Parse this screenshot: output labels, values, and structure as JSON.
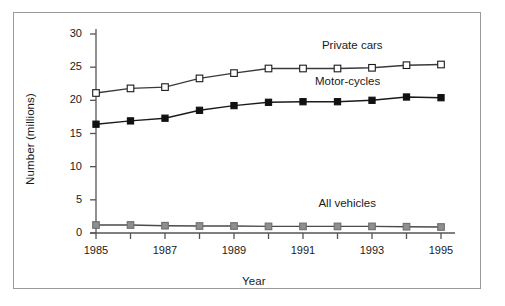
{
  "chart_data": {
    "type": "line",
    "title": "",
    "xlabel": "Year",
    "ylabel": "Number (millions)",
    "x": [
      1985,
      1986,
      1987,
      1988,
      1989,
      1990,
      1991,
      1992,
      1993,
      1994,
      1995
    ],
    "xtick_labels": [
      "1985",
      "1987",
      "1989",
      "1991",
      "1993",
      "1995"
    ],
    "xtick_values": [
      1985,
      1987,
      1989,
      1991,
      1993,
      1995
    ],
    "xlim": [
      1985,
      1995
    ],
    "ytick_labels": [
      "0",
      "5",
      "10",
      "15",
      "20",
      "25",
      "30"
    ],
    "ytick_values": [
      0,
      5,
      10,
      15,
      20,
      25,
      30
    ],
    "ylim": [
      0,
      30
    ],
    "grid": false,
    "legend_position": "inline-right-annotations",
    "series": [
      {
        "name": "Private cars",
        "marker": "open-square",
        "marker_fill": "#ffffff",
        "marker_edge": "#1a1a1a",
        "line_color": "#3a3a3a",
        "values": [
          21.1,
          21.8,
          22.0,
          23.3,
          24.1,
          24.8,
          24.8,
          24.8,
          24.9,
          25.3,
          25.4
        ]
      },
      {
        "name": "Motor-cycles",
        "marker": "filled-square",
        "marker_fill": "#111111",
        "marker_edge": "#111111",
        "line_color": "#1a1a1a",
        "values": [
          16.4,
          16.9,
          17.3,
          18.5,
          19.2,
          19.7,
          19.8,
          19.8,
          20.0,
          20.5,
          20.4
        ]
      },
      {
        "name": "All vehicles",
        "marker": "gray-square",
        "marker_fill": "#8f8f8f",
        "marker_edge": "#6e6e6e",
        "line_color": "#4a4a4a",
        "values": [
          1.2,
          1.2,
          1.1,
          1.05,
          1.05,
          1.0,
          1.0,
          1.0,
          1.0,
          0.95,
          0.9
        ]
      }
    ],
    "annotations": [
      {
        "text": "Private cars",
        "x": 1993.2,
        "y": 28.0
      },
      {
        "text": "Motor-cycles",
        "x": 1993.0,
        "y": 22.6
      },
      {
        "text": "All vehicles",
        "x": 1993.1,
        "y": 4.2
      }
    ]
  }
}
